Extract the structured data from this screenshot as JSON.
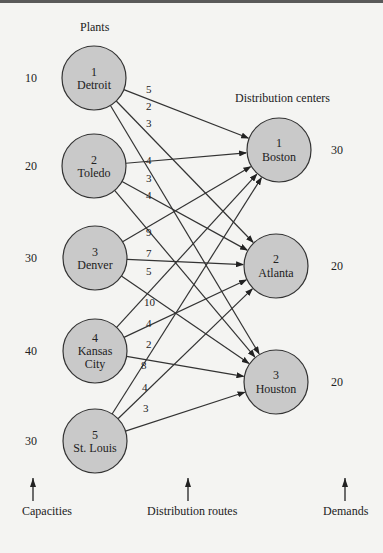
{
  "headers": {
    "plants": "Plants",
    "distribution_centers": "Distribution centers"
  },
  "plants": [
    {
      "id": "1",
      "name": [
        "Detroit"
      ],
      "capacity": "10",
      "cx": 94,
      "cy": 78
    },
    {
      "id": "2",
      "name": [
        "Toledo"
      ],
      "capacity": "20",
      "cx": 94,
      "cy": 166
    },
    {
      "id": "3",
      "name": [
        "Denver"
      ],
      "capacity": "30",
      "cx": 95,
      "cy": 258
    },
    {
      "id": "4",
      "name": [
        "Kansas",
        "City"
      ],
      "capacity": "40",
      "cx": 95,
      "cy": 351
    },
    {
      "id": "5",
      "name": [
        "St. Louis"
      ],
      "capacity": "30",
      "cx": 95,
      "cy": 441
    }
  ],
  "centers": [
    {
      "id": "1",
      "name": "Boston",
      "demand": "30",
      "cx": 279,
      "cy": 150
    },
    {
      "id": "2",
      "name": "Atlanta",
      "demand": "20",
      "cx": 276,
      "cy": 266
    },
    {
      "id": "3",
      "name": "Houston",
      "demand": "20",
      "cx": 276,
      "cy": 382
    }
  ],
  "routes": [
    {
      "from": 0,
      "to": 0,
      "cost": "5",
      "lx": 146,
      "ly": 93
    },
    {
      "from": 0,
      "to": 1,
      "cost": "2",
      "lx": 146,
      "ly": 110
    },
    {
      "from": 0,
      "to": 2,
      "cost": "3",
      "lx": 146,
      "ly": 127
    },
    {
      "from": 1,
      "to": 0,
      "cost": "4",
      "lx": 146,
      "ly": 164
    },
    {
      "from": 1,
      "to": 1,
      "cost": "3",
      "lx": 146,
      "ly": 182
    },
    {
      "from": 1,
      "to": 2,
      "cost": "4",
      "lx": 146,
      "ly": 199
    },
    {
      "from": 2,
      "to": 0,
      "cost": "9",
      "lx": 146,
      "ly": 236
    },
    {
      "from": 2,
      "to": 1,
      "cost": "7",
      "lx": 146,
      "ly": 257
    },
    {
      "from": 2,
      "to": 2,
      "cost": "5",
      "lx": 146,
      "ly": 275
    },
    {
      "from": 3,
      "to": 0,
      "cost": "10",
      "lx": 144,
      "ly": 306
    },
    {
      "from": 3,
      "to": 1,
      "cost": "4",
      "lx": 146,
      "ly": 327
    },
    {
      "from": 3,
      "to": 2,
      "cost": "2",
      "lx": 146,
      "ly": 348
    },
    {
      "from": 4,
      "to": 0,
      "cost": "8",
      "lx": 141,
      "ly": 369
    },
    {
      "from": 4,
      "to": 1,
      "cost": "4",
      "lx": 142,
      "ly": 391
    },
    {
      "from": 4,
      "to": 2,
      "cost": "3",
      "lx": 143,
      "ly": 412
    }
  ],
  "footer": {
    "capacities": "Capacities",
    "routes": "Distribution routes",
    "demands": "Demands"
  },
  "colors": {
    "node_fill": "#c9c9c9",
    "stroke": "#333333",
    "background": "#f4f4f2"
  }
}
